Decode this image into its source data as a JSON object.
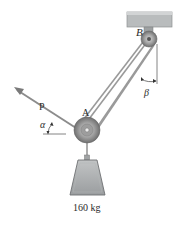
{
  "figure": {
    "labels": {
      "pulley_a": "A",
      "pulley_b": "B",
      "force": "P",
      "angle_alpha": "α",
      "angle_beta": "β",
      "mass": "160 kg"
    },
    "colors": {
      "ceiling": "#b9bcbd",
      "rope": "#9a9a9a",
      "pulley": "#8e8e8e",
      "weight": "#9da0a2",
      "arrow": "#8c8c8c"
    }
  }
}
